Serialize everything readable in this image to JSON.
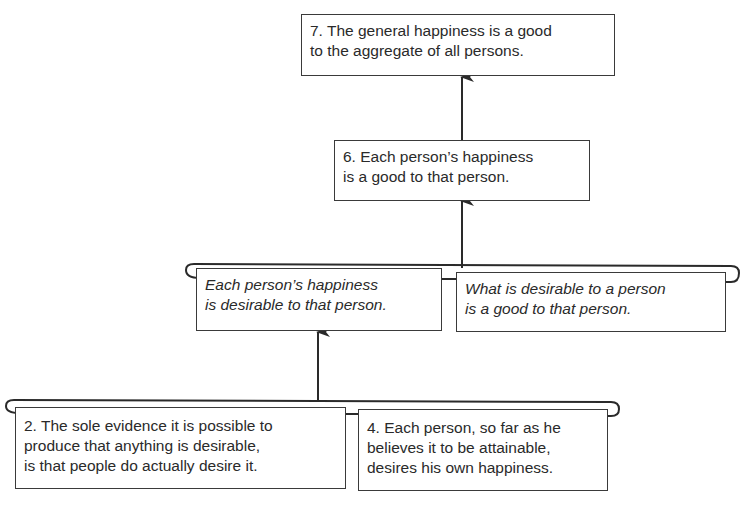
{
  "diagram": {
    "type": "argument-map",
    "nodes": {
      "claim7": {
        "id": "7",
        "lines": [
          "7. The general happiness is a good",
          "to the aggregate of all persons."
        ],
        "style": "normal"
      },
      "claim6": {
        "id": "6",
        "lines": [
          "6. Each person’s happiness",
          "is a good to that person."
        ],
        "style": "normal"
      },
      "implicit_a": {
        "id": "",
        "lines": [
          "Each person’s happiness",
          "is desirable to that person."
        ],
        "style": "italic"
      },
      "implicit_b": {
        "id": "",
        "lines": [
          "What is desirable to a person",
          "is a good to that person."
        ],
        "style": "italic"
      },
      "premise2": {
        "id": "2",
        "lines": [
          "2. The sole evidence it is possible to",
          "produce that anything is desirable,",
          "is that people do actually desire it."
        ],
        "style": "normal"
      },
      "premise4": {
        "id": "4",
        "lines": [
          "4. Each person, so far as he",
          "believes it to be attainable,",
          "desires his own happiness."
        ],
        "style": "normal"
      }
    },
    "edges": [
      {
        "from": "premise2+premise4",
        "to": "implicit_a",
        "kind": "linked"
      },
      {
        "from": "implicit_a+implicit_b",
        "to": "claim6",
        "kind": "linked"
      },
      {
        "from": "claim6",
        "to": "claim7",
        "kind": "single"
      }
    ],
    "colors": {
      "line": "#2a2a2a",
      "box_border": "#3a3a3a",
      "background": "#ffffff"
    }
  }
}
